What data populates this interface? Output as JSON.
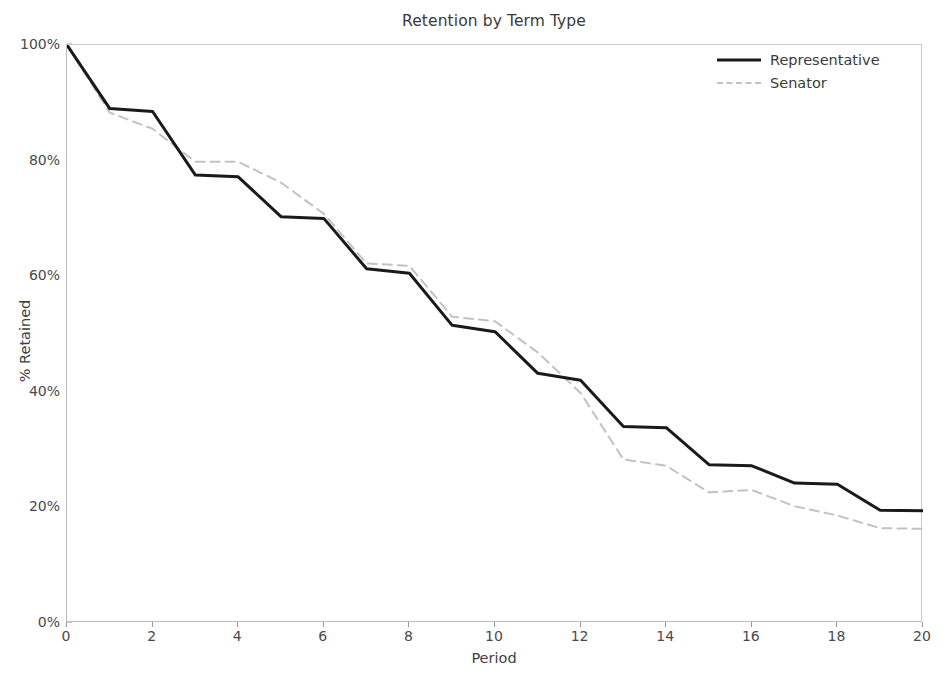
{
  "chart_data": {
    "type": "line",
    "title": "Retention by Term Type",
    "xlabel": "Period",
    "ylabel": "% Retained",
    "xlim": [
      0,
      20
    ],
    "ylim": [
      0,
      100
    ],
    "grid": false,
    "legend_position": "upper right",
    "x_ticks": [
      "0",
      "2",
      "4",
      "6",
      "8",
      "10",
      "12",
      "14",
      "16",
      "18",
      "20"
    ],
    "x_tick_values": [
      0,
      2,
      4,
      6,
      8,
      10,
      12,
      14,
      16,
      18,
      20
    ],
    "y_ticks": [
      "0%",
      "20%",
      "40%",
      "60%",
      "80%",
      "100%"
    ],
    "y_tick_values": [
      0,
      20,
      40,
      60,
      80,
      100
    ],
    "x": [
      0,
      1,
      2,
      3,
      4,
      5,
      6,
      7,
      8,
      9,
      10,
      11,
      12,
      13,
      14,
      15,
      16,
      17,
      18,
      19,
      20
    ],
    "series": [
      {
        "name": "Representative",
        "style": "solid",
        "color": "#1a1a1a",
        "width": 3,
        "values": [
          100.0,
          89.0,
          88.5,
          77.5,
          77.2,
          70.3,
          70.0,
          61.3,
          60.5,
          51.5,
          50.4,
          43.2,
          42.0,
          34.0,
          33.8,
          27.4,
          27.2,
          24.2,
          24.0,
          19.5,
          19.4
        ]
      },
      {
        "name": "Senator",
        "style": "dashed",
        "color": "#c2c2c2",
        "width": 2,
        "values": [
          100.0,
          88.3,
          85.5,
          79.8,
          79.8,
          76.2,
          70.8,
          62.2,
          61.8,
          53.0,
          52.2,
          46.8,
          39.8,
          28.3,
          27.2,
          22.6,
          23.0,
          20.2,
          18.6,
          16.4,
          16.3
        ]
      }
    ]
  },
  "legend": {
    "items": [
      {
        "label": "Representative"
      },
      {
        "label": "Senator"
      }
    ]
  },
  "colors": {
    "representative": "#1a1a1a",
    "senator": "#c2c2c2",
    "axis": "#bdbdbd",
    "text": "#3b3b3b",
    "background": "#ffffff"
  }
}
